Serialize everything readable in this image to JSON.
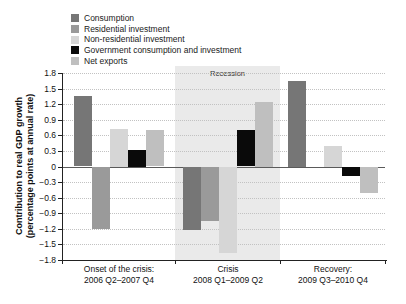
{
  "figure": {
    "y_axis_label_line1": "Contribution to real GDP growth",
    "y_axis_label_line2": "(percentage points at annual rate)",
    "recession_label": "Recession"
  },
  "legend": [
    {
      "label": "Consumption",
      "color": "#767676"
    },
    {
      "label": "Residential investment",
      "color": "#9a9a9a"
    },
    {
      "label": "Non-residential investment",
      "color": "#d6d6d6"
    },
    {
      "label": "Government consumption and investment",
      "color": "#0a0a0a"
    },
    {
      "label": "Net exports",
      "color": "#bfbfbf"
    }
  ],
  "chart_data": {
    "type": "bar",
    "title": "",
    "ylabel": "Contribution to real GDP growth (percentage points at annual rate)",
    "categories": [
      {
        "line1": "Onset of the crisis:",
        "line2": "2006 Q2–2007 Q4"
      },
      {
        "line1": "Crisis",
        "line2": "2008 Q1–2009 Q2"
      },
      {
        "line1": "Recovery:",
        "line2": "2009 Q3–2010 Q4"
      }
    ],
    "series": [
      {
        "name": "Consumption",
        "color": "#767676",
        "values": [
          1.35,
          -1.22,
          1.65
        ]
      },
      {
        "name": "Residential investment",
        "color": "#9a9a9a",
        "values": [
          -1.2,
          -1.03,
          0.0
        ]
      },
      {
        "name": "Non-residential investment",
        "color": "#d6d6d6",
        "values": [
          0.73,
          -1.65,
          0.4
        ]
      },
      {
        "name": "Government consumption and investment",
        "color": "#0a0a0a",
        "values": [
          0.32,
          0.7,
          -0.17
        ]
      },
      {
        "name": "Net exports",
        "color": "#bfbfbf",
        "values": [
          0.7,
          1.25,
          -0.5
        ]
      }
    ],
    "ylim": [
      -1.8,
      1.8
    ],
    "y_tick_step": 0.3,
    "y_tick_values": [
      1.8,
      1.5,
      1.2,
      0.9,
      0.6,
      0.3,
      0,
      -0.3,
      -0.6,
      -0.9,
      -1.2,
      -1.5,
      -1.8
    ],
    "y_tick_labels": [
      "1.8",
      "1.5",
      "1.2",
      "0.9",
      "0.6",
      "0.3",
      "0",
      "−0.3",
      "−0.6",
      "−0.9",
      "−1.2",
      "−1.5",
      "−1.8"
    ],
    "grid": "dotted horizontal lines at each 0.3 step, solid zero line",
    "legend_position": "top-left",
    "recession_band": {
      "category_index": 1,
      "label": "Recession"
    }
  }
}
